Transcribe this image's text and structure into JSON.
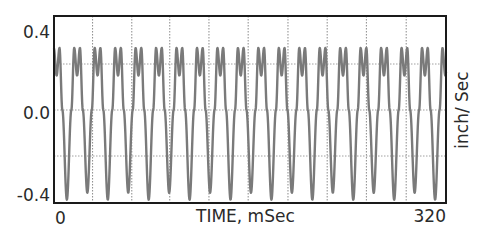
{
  "chart_data": {
    "type": "line",
    "title": "",
    "xlabel": "TIME, mSec",
    "ylabel": "inch/ Sec",
    "xlim": [
      0,
      320
    ],
    "ylim": [
      -0.4,
      0.41
    ],
    "x_tick_labels": [
      "0",
      "320"
    ],
    "y_tick_labels": [
      "0.4",
      "0.0",
      "-0.4"
    ],
    "y_ticks": [
      0.4,
      0.0,
      -0.4
    ],
    "grid": true,
    "grid_style": "dotted",
    "vertical_gridlines_ms": [
      31.5,
      63.5,
      94.5,
      126.5,
      158.5,
      191,
      223,
      255,
      287.5
    ],
    "horizontal_gridlines": [
      0.2,
      0.0,
      -0.2
    ],
    "legend": null,
    "series": [
      {
        "name": "velocity",
        "color": "#7a7a7a",
        "period_ms": 16.7,
        "first_trough_ms": 10.5,
        "cycle_shape": {
          "phase": [
            0.0,
            0.22,
            0.36,
            0.5,
            0.64,
            0.78,
            1.0
          ],
          "value": [
            -0.39,
            0.0,
            0.27,
            0.15,
            0.27,
            0.0,
            -0.39
          ]
        },
        "x": [
          0,
          3,
          6,
          8.5,
          10.5,
          14,
          16.5,
          19,
          21.5,
          24,
          27.2,
          30.7,
          33.2,
          35.7,
          38.2,
          40.7,
          43.9,
          47.4,
          49.9,
          52.4,
          54.9,
          57.4,
          60.6,
          64.1,
          66.6,
          69.1,
          71.6,
          74.1,
          77.3,
          80.8,
          83.3,
          85.8,
          88.3,
          90.8,
          94.0
        ],
        "y": [
          0.16,
          0.27,
          0.15,
          0.0,
          -0.39,
          0.0,
          0.27,
          0.15,
          0.27,
          0.0,
          -0.36,
          0.0,
          0.27,
          0.15,
          0.27,
          0.0,
          -0.39,
          0.0,
          0.27,
          0.15,
          0.27,
          0.0,
          -0.36,
          0.0,
          0.27,
          0.15,
          0.27,
          0.0,
          -0.39,
          0.0,
          0.27,
          0.15,
          0.27,
          0.0,
          -0.36
        ]
      }
    ]
  }
}
